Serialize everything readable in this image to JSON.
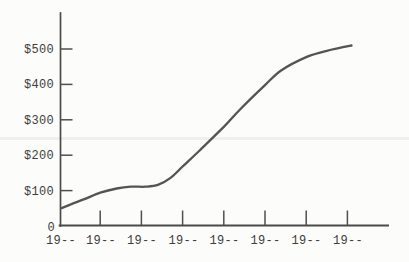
{
  "figure": {
    "background_color": "#fcfcfa",
    "curve_color": "#545454",
    "axis_color": "#4a4a4a",
    "text_color": "#3d3d3d"
  },
  "chart_data": {
    "type": "line",
    "title": "",
    "xlabel": "",
    "ylabel": "",
    "grid": false,
    "legend": "none",
    "ylim": [
      0,
      600
    ],
    "y_tick_values": [
      500,
      400,
      300,
      200,
      100
    ],
    "y_tick_labels": [
      "$500",
      "$400",
      "$300",
      "$200",
      "$100"
    ],
    "y_origin_label": "0",
    "x_tick_labels": [
      "19--",
      "19--",
      "19--",
      "19--",
      "19--",
      "19--",
      "19--",
      "19--"
    ],
    "series": [
      {
        "name": "dollar-value-over-years",
        "points": [
          {
            "t": 0.05,
            "v": 50
          },
          {
            "t": 0.3,
            "v": 62
          },
          {
            "t": 0.6,
            "v": 75
          },
          {
            "t": 1.0,
            "v": 94
          },
          {
            "t": 1.4,
            "v": 106
          },
          {
            "t": 1.75,
            "v": 111
          },
          {
            "t": 2.1,
            "v": 111
          },
          {
            "t": 2.4,
            "v": 116
          },
          {
            "t": 2.7,
            "v": 135
          },
          {
            "t": 3.0,
            "v": 168
          },
          {
            "t": 3.4,
            "v": 212
          },
          {
            "t": 4.0,
            "v": 280
          },
          {
            "t": 4.4,
            "v": 330
          },
          {
            "t": 5.0,
            "v": 398
          },
          {
            "t": 5.4,
            "v": 440
          },
          {
            "t": 6.0,
            "v": 477
          },
          {
            "t": 6.5,
            "v": 495
          },
          {
            "t": 7.1,
            "v": 510
          }
        ]
      }
    ]
  }
}
